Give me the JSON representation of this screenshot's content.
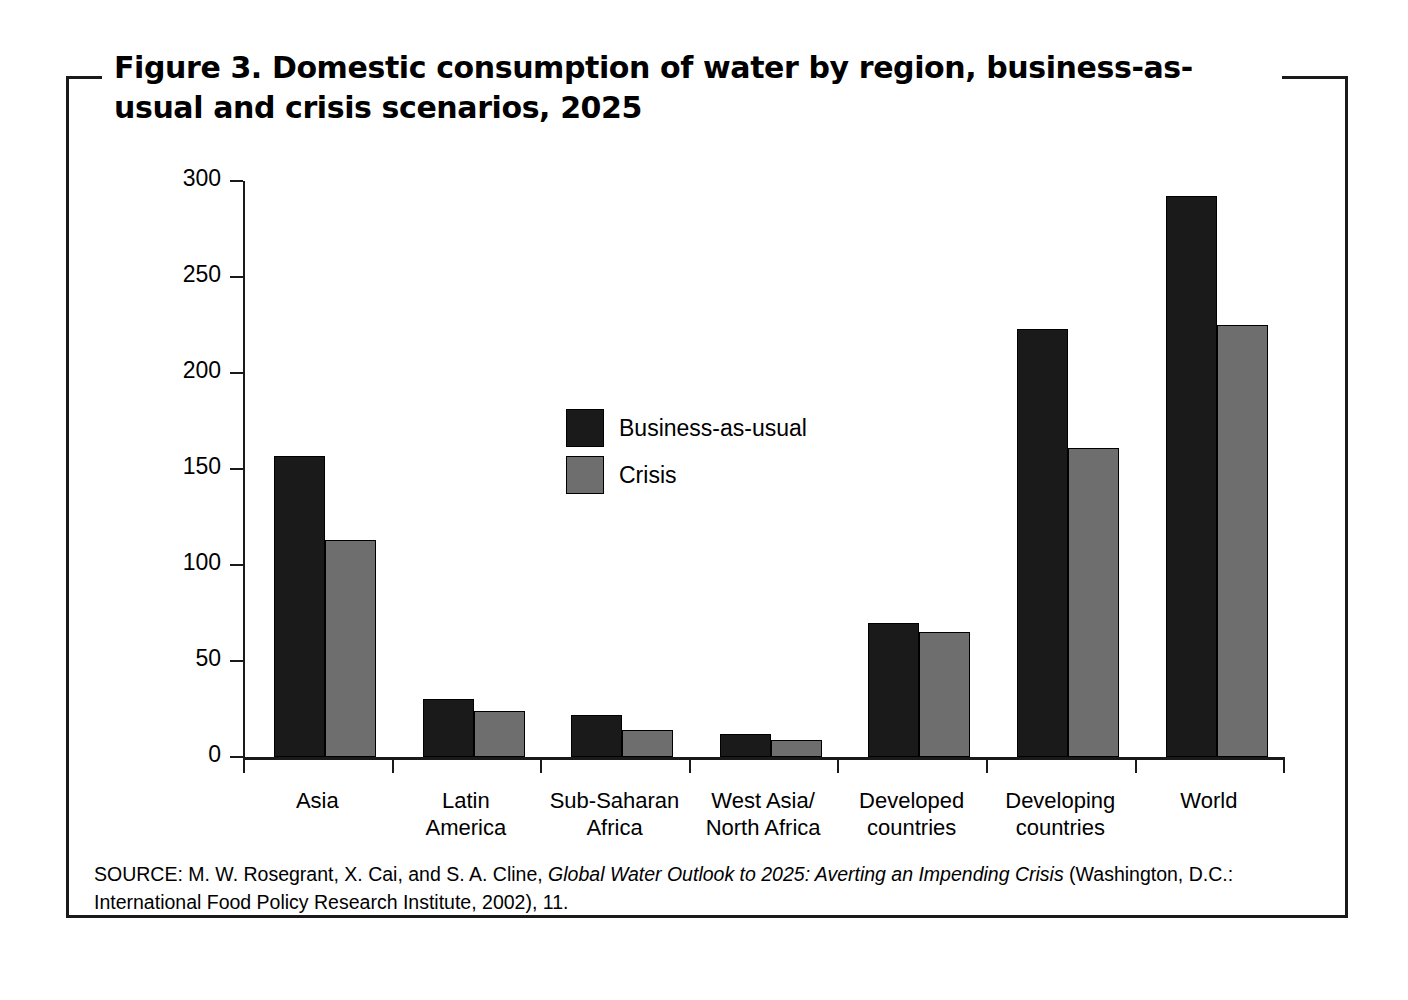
{
  "figure": {
    "title": "Figure 3. Domestic consumption of water by region, business-as-usual and crisis scenarios, 2025",
    "source_prefix": "SOURCE: M. W. Rosegrant, X. Cai, and S. A. Cline, ",
    "source_italic": "Global Water Outlook to 2025: Averting an Impending Crisis",
    "source_suffix": " (Washington, D.C.: International Food Policy Research Institute, 2002), 11."
  },
  "colors": {
    "business_as_usual": "#1a1a1a",
    "crisis": "#6e6e6e",
    "axis": "#1a1a1a",
    "background": "#ffffff"
  },
  "chart_data": {
    "type": "bar",
    "title": "Figure 3. Domestic consumption of water by region, business-as-usual and crisis scenarios, 2025",
    "xlabel": "",
    "ylabel": "Water demand km³",
    "ylabel_base": "Water demand km",
    "ylabel_sup": "3",
    "ylim": [
      0,
      300
    ],
    "yticks": [
      0,
      50,
      100,
      150,
      200,
      250,
      300
    ],
    "ytick_labels": [
      "0",
      "50",
      "100",
      "150",
      "200",
      "250",
      "300"
    ],
    "grid": false,
    "legend_position": "upper-left-inside",
    "categories": [
      "Asia",
      "Latin America",
      "Sub-Saharan Africa",
      "West Asia/ North Africa",
      "Developed countries",
      "Developing countries",
      "World"
    ],
    "category_lines": [
      [
        "Asia"
      ],
      [
        "Latin",
        "America"
      ],
      [
        "Sub-Saharan",
        "Africa"
      ],
      [
        "West Asia/",
        "North Africa"
      ],
      [
        "Developed",
        "countries"
      ],
      [
        "Developing",
        "countries"
      ],
      [
        "World"
      ]
    ],
    "series": [
      {
        "name": "Business-as-usual",
        "color": "#1a1a1a",
        "values": [
          157,
          30,
          22,
          12,
          70,
          223,
          292
        ]
      },
      {
        "name": "Crisis",
        "color": "#6e6e6e",
        "values": [
          113,
          24,
          14,
          9,
          65,
          161,
          225
        ]
      }
    ]
  }
}
